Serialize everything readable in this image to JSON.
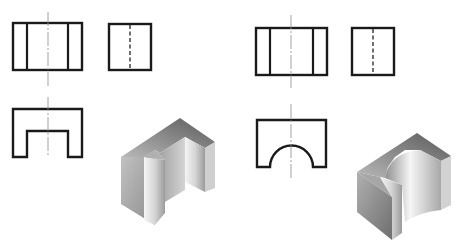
{
  "figure": {
    "models": [
      {
        "id": "model-a",
        "feature": "rectangular-slot",
        "views": [
          "front-view",
          "side-view",
          "top-view",
          "isometric"
        ]
      },
      {
        "id": "model-b",
        "feature": "semicircular-slot",
        "views": [
          "front-view",
          "side-view",
          "top-view",
          "isometric"
        ]
      }
    ]
  },
  "colors": {
    "line": "#1a1a1a",
    "centerline": "#8a8a8a",
    "shade_dark": "#5e5e5e",
    "shade_mid": "#9a9a9a",
    "shade_light": "#ededed"
  }
}
